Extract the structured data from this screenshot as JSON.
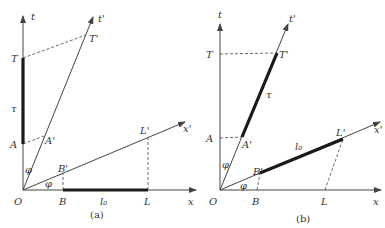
{
  "figure": {
    "panels": [
      {
        "caption": "(a)",
        "labels": {
          "t": "t",
          "t_prime": "t'",
          "x": "x",
          "x_prime": "x'",
          "O": "O",
          "T": "T",
          "T_prime": "T'",
          "A": "A",
          "A_prime": "A'",
          "B": "B",
          "B_prime": "B'",
          "L": "L",
          "L_prime": "L'",
          "tau": "τ",
          "l0": "l₀",
          "phi_upper": "φ",
          "phi_lower": "φ"
        },
        "description": "Proper time τ marked as thick segment on t-axis from A to T; proper length l₀ marked as thick segment on x-axis from B to L."
      },
      {
        "caption": "(b)",
        "labels": {
          "t": "t",
          "t_prime": "t'",
          "x": "x",
          "x_prime": "x'",
          "O": "O",
          "T": "T",
          "T_prime": "T'",
          "A": "A",
          "A_prime": "A'",
          "B": "B",
          "B_prime": "B'",
          "L": "L",
          "L_prime": "L'",
          "tau": "τ",
          "l0": "l₀",
          "phi_upper": "φ",
          "phi_lower": "φ"
        },
        "description": "Proper time τ marked as thick segment on t'-axis from A' to T'; proper length l₀ marked as thick segment on x'-axis from B' to L'."
      }
    ],
    "colors": {
      "line": "#444444",
      "thick": "#1a1a1a",
      "text": "#333333"
    }
  }
}
